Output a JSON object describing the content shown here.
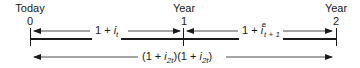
{
  "diagram": {
    "type": "timeline",
    "points": [
      {
        "label": "Today",
        "number": "0"
      },
      {
        "label": "Year",
        "number": "1"
      },
      {
        "label": "Year",
        "number": "2"
      }
    ],
    "segments": [
      {
        "from": "0",
        "to": "1",
        "expression": {
          "base": "1 + ",
          "var": "i",
          "sub": "t",
          "sup": ""
        }
      },
      {
        "from": "1",
        "to": "2",
        "expression": {
          "base": "1 + ",
          "var": "i",
          "sub": "t + 1",
          "sup": "e"
        }
      }
    ],
    "span": {
      "from": "0",
      "to": "2",
      "expression": {
        "part1": {
          "open": "(1 + ",
          "var": "i",
          "sub": "2t",
          "close": ")"
        },
        "part2": {
          "open": "(1 + ",
          "var": "i",
          "sub": "2t",
          "close": ")"
        }
      }
    }
  },
  "colors": {
    "line": "#1a1a1a",
    "background": "#ffffff"
  }
}
